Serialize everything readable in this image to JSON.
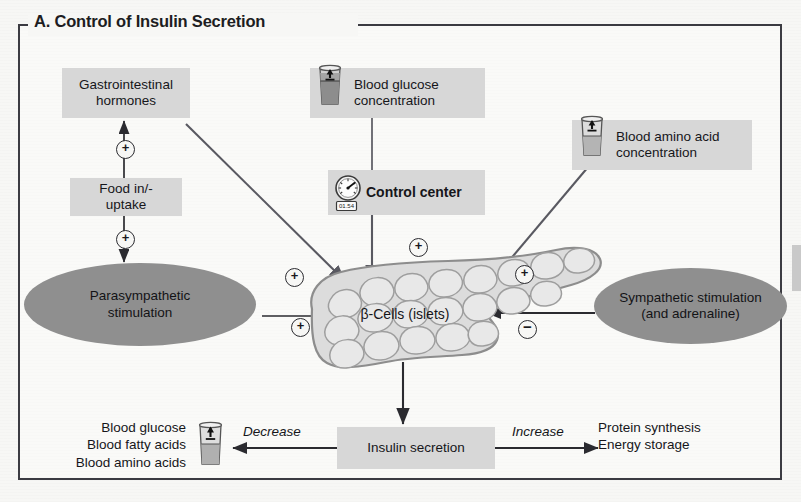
{
  "panel": {
    "title": "A. Control of Insulin Secretion",
    "frame_color": "#3b3b42",
    "box_fill": "#d7d7d7",
    "ellipse_fill": "#8f8f8f",
    "page_background": "#f7f7f5"
  },
  "nodes": {
    "gi_hormones": {
      "label": "Gastrointestinal\nhormones"
    },
    "food_intake": {
      "label": "Food in/-\nuptake"
    },
    "parasympathetic": {
      "label": "Parasympathetic\nstimulation"
    },
    "blood_glucose": {
      "label": "Blood glucose\nconcentration",
      "icon": "beaker-up-icon"
    },
    "control_center": {
      "label": "Control center",
      "icon": "gauge-icon",
      "icon_readout": "01.54"
    },
    "blood_amino_acid": {
      "label": "Blood amino acid\nconcentration",
      "icon": "beaker-up-icon"
    },
    "beta_cells": {
      "label": "β-Cells (islets)"
    },
    "sympathetic": {
      "label": "Sympathetic stimulation\n(and adrenaline)"
    },
    "insulin_secretion": {
      "label": "Insulin secretion"
    },
    "blood_levels": {
      "label": "Blood glucose\nBlood fatty acids\nBlood amino acids",
      "icon": "beaker-down-icon"
    },
    "outputs": {
      "label": "Protein synthesis\nEnergy storage"
    }
  },
  "edge_labels": {
    "decrease": "Decrease",
    "increase": "Increase"
  },
  "signs": {
    "plus": "⊕",
    "minus": "⊖",
    "plus_glyph": "+",
    "minus_glyph": "−"
  },
  "sign_markers": [
    {
      "id": "food-to-gi",
      "sign": "+"
    },
    {
      "id": "food-to-parasym",
      "sign": "+"
    },
    {
      "id": "gi-to-beta",
      "sign": "+"
    },
    {
      "id": "control-to-beta",
      "sign": "+"
    },
    {
      "id": "parasym-to-beta",
      "sign": "+"
    },
    {
      "id": "aminoacid-to-beta",
      "sign": "+"
    },
    {
      "id": "sympathetic-to-beta",
      "sign": "−"
    }
  ]
}
